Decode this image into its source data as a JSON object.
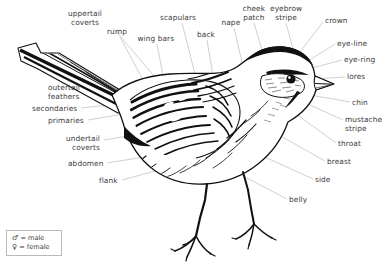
{
  "diagram": {
    "style": "pen-and-ink line drawing",
    "background_color": "#ffffff",
    "ink_color": "#111111",
    "label_color": "#3b3b3b",
    "leader_line_color": "#b0b0b0"
  },
  "labels": [
    {
      "id": "uppertail-coverts",
      "text": "uppertail\ncoverts",
      "x": 85,
      "y": 10,
      "align": "c",
      "leader": [
        113,
        28,
        155,
        77
      ]
    },
    {
      "id": "rump",
      "text": "rump",
      "x": 117,
      "y": 28,
      "align": "c",
      "leader": [
        120,
        37,
        143,
        80
      ]
    },
    {
      "id": "wing-bars",
      "text": "wing bars",
      "x": 156,
      "y": 35,
      "align": "c",
      "leader": [
        157,
        44,
        165,
        86
      ]
    },
    {
      "id": "scapulars",
      "text": "scapulars",
      "x": 178,
      "y": 14,
      "align": "c",
      "leader": [
        182,
        23,
        196,
        78
      ]
    },
    {
      "id": "back",
      "text": "back",
      "x": 206,
      "y": 31,
      "align": "c",
      "leader": [
        207,
        40,
        213,
        76
      ]
    },
    {
      "id": "nape",
      "text": "nape",
      "x": 231,
      "y": 19,
      "align": "c",
      "leader": [
        234,
        28,
        243,
        66
      ]
    },
    {
      "id": "cheek-patch",
      "text": "cheek\npatch",
      "x": 254,
      "y": 5,
      "align": "c",
      "leader": [
        254,
        23,
        272,
        84
      ]
    },
    {
      "id": "eyebrow-stripe",
      "text": "eyebrow\nstripe",
      "x": 286,
      "y": 5,
      "align": "c",
      "leader": [
        286,
        23,
        297,
        64
      ]
    },
    {
      "id": "crown",
      "text": "crown",
      "x": 325,
      "y": 17,
      "align": "l",
      "leader": [
        323,
        22,
        300,
        52
      ]
    },
    {
      "id": "eye-line",
      "text": "eye-line",
      "x": 337,
      "y": 40,
      "align": "l",
      "leader": [
        335,
        44,
        303,
        64
      ]
    },
    {
      "id": "eye-ring",
      "text": "eye-ring",
      "x": 344,
      "y": 56,
      "align": "l",
      "leader": [
        342,
        60,
        312,
        68
      ]
    },
    {
      "id": "lores",
      "text": "lores",
      "x": 347,
      "y": 73,
      "align": "l",
      "leader": [
        345,
        77,
        313,
        79
      ]
    },
    {
      "id": "chin",
      "text": "chin",
      "x": 352,
      "y": 99,
      "align": "l",
      "leader": [
        350,
        102,
        310,
        95
      ]
    },
    {
      "id": "mustache-stripe",
      "text": "mustache\nstripe",
      "x": 345,
      "y": 116,
      "align": "l",
      "leader": [
        343,
        120,
        297,
        99
      ]
    },
    {
      "id": "throat",
      "text": "throat",
      "x": 338,
      "y": 140,
      "align": "l",
      "leader": [
        336,
        143,
        288,
        108
      ]
    },
    {
      "id": "breast",
      "text": "breast",
      "x": 327,
      "y": 158,
      "align": "l",
      "leader": [
        325,
        161,
        272,
        131
      ]
    },
    {
      "id": "side",
      "text": "side",
      "x": 315,
      "y": 176,
      "align": "l",
      "leader": [
        313,
        179,
        245,
        148
      ]
    },
    {
      "id": "belly",
      "text": "belly",
      "x": 289,
      "y": 196,
      "align": "l",
      "leader": [
        287,
        199,
        228,
        168
      ]
    },
    {
      "id": "flank",
      "text": "flank",
      "x": 118,
      "y": 177,
      "align": "r",
      "leader": [
        122,
        180,
        196,
        160
      ]
    },
    {
      "id": "abdomen",
      "text": "abdomen",
      "x": 103,
      "y": 160,
      "align": "r",
      "leader": [
        107,
        163,
        188,
        150
      ]
    },
    {
      "id": "undertail-coverts",
      "text": "undertail\ncoverts",
      "x": 100,
      "y": 135,
      "align": "r",
      "leader": [
        104,
        140,
        176,
        128
      ]
    },
    {
      "id": "primaries",
      "text": "primaries",
      "x": 84,
      "y": 117,
      "align": "r",
      "leader": [
        88,
        120,
        147,
        110
      ]
    },
    {
      "id": "secondaries",
      "text": "secondaries",
      "x": 77,
      "y": 105,
      "align": "r",
      "leader": [
        81,
        108,
        140,
        102
      ]
    },
    {
      "id": "outertail-feathers",
      "text": "outertail\nfeathers",
      "x": 48,
      "y": 84,
      "align": "l",
      "leader": [
        75,
        89,
        100,
        78
      ]
    }
  ],
  "legend": {
    "rows": [
      {
        "symbol": "♂",
        "text": " = male"
      },
      {
        "symbol": "♀",
        "text": " = female"
      }
    ]
  }
}
